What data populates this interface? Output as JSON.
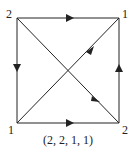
{
  "diagram": {
    "caption": "(2, 2, 1, 1)",
    "vertices": [
      {
        "id": "tl",
        "label": "2",
        "x": 17,
        "y": 18
      },
      {
        "id": "tr",
        "label": "1",
        "x": 119,
        "y": 18
      },
      {
        "id": "bl",
        "label": "1",
        "x": 17,
        "y": 123
      },
      {
        "id": "br",
        "label": "2",
        "x": 119,
        "y": 123
      }
    ],
    "edges": [
      {
        "from": "tl",
        "to": "tr",
        "direction": "right"
      },
      {
        "from": "tl",
        "to": "bl",
        "direction": "down"
      },
      {
        "from": "bl",
        "to": "br",
        "direction": "right"
      },
      {
        "from": "br",
        "to": "tr",
        "direction": "up"
      },
      {
        "from": "tr",
        "to": "bl",
        "direction": "down-left"
      },
      {
        "from": "br",
        "to": "tl",
        "direction": "up-left"
      }
    ],
    "colors": {
      "stroke": "#222222",
      "background": "#ffffff"
    }
  }
}
